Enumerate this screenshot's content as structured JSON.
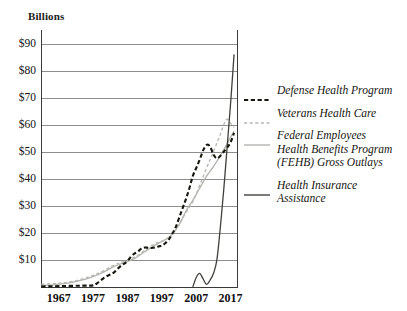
{
  "axis_unit_label": "Billions",
  "colors": {
    "defense": "#16160f",
    "veterans": "#b9b9b4",
    "fehb": "#b3b3ae",
    "hia": "#41413c",
    "axis": "#3a3a3a",
    "grid": "#8d8d8d",
    "text": "#15150f",
    "background": "#ffffff"
  },
  "legend": {
    "entries": [
      {
        "label": "Defense Health Program",
        "swatch": "dashed-bold-dark",
        "icon": "dashed-line-icon"
      },
      {
        "label": "Veterans Health Care",
        "swatch": "dashed-light-gray",
        "icon": "dashed-line-icon"
      },
      {
        "label": "Federal Employees\nHealth Benefits Program\n(FEHB) Gross Outlays",
        "swatch": "solid-light-gray",
        "icon": "solid-line-icon"
      },
      {
        "label": "Health Insurance\nAssistance",
        "swatch": "solid-dark",
        "icon": "solid-line-icon"
      }
    ]
  },
  "chart_data": {
    "type": "line",
    "title": "",
    "subtitle": "",
    "xlabel": "",
    "ylabel": "Billions",
    "ylim": [
      0,
      95
    ],
    "xlim": [
      1962,
      2019
    ],
    "grid": true,
    "gridlines_y": [
      10,
      20,
      30,
      40,
      50,
      60,
      70,
      80,
      90
    ],
    "legend_position": "right",
    "ytick_labels": [
      "$90",
      "$80",
      "$70",
      "$60",
      "$50",
      "$40",
      "$30",
      "$20",
      "$10"
    ],
    "ytick_values": [
      90,
      80,
      70,
      60,
      50,
      40,
      30,
      20,
      10
    ],
    "xtick_labels": [
      "1967",
      "1977",
      "1987",
      "1997",
      "2007",
      "2017"
    ],
    "xtick_values": [
      1967,
      1977,
      1987,
      1997,
      2007,
      2017
    ],
    "series": [
      {
        "name": "Defense Health Program",
        "style": "dashed",
        "color": "#16160f",
        "width": 2.1,
        "x": [
          1962,
          1966,
          1970,
          1974,
          1977,
          1978,
          1979,
          1980,
          1981,
          1982,
          1983,
          1984,
          1985,
          1986,
          1987,
          1988,
          1989,
          1990,
          1991,
          1992,
          1993,
          1994,
          1995,
          1996,
          1997,
          1998,
          1999,
          2000,
          2001,
          2002,
          2003,
          2004,
          2005,
          2006,
          2007,
          2008,
          2009,
          2010,
          2011,
          2012,
          2013,
          2014,
          2015,
          2016,
          2017,
          2018
        ],
        "y": [
          0.2,
          0.3,
          0.4,
          0.5,
          0.6,
          1.2,
          2.2,
          3.2,
          4.0,
          4.6,
          5.3,
          6.6,
          7.7,
          8.6,
          9.6,
          11.2,
          12.3,
          13.0,
          14.2,
          14.6,
          14.5,
          14.4,
          14.6,
          15.0,
          15.3,
          16.2,
          17.5,
          19.6,
          22.0,
          25.5,
          29.0,
          32.5,
          36.5,
          41.0,
          44.0,
          47.0,
          50.5,
          52.5,
          52.0,
          49.0,
          47.5,
          48.5,
          50.0,
          51.5,
          53.5,
          57.0
        ]
      },
      {
        "name": "Veterans Health Care",
        "style": "dashed",
        "color": "#b9b9b4",
        "width": 1.4,
        "x": [
          1962,
          1966,
          1970,
          1974,
          1977,
          1980,
          1983,
          1986,
          1989,
          1992,
          1995,
          1998,
          2000,
          2002,
          2004,
          2006,
          2008,
          2010,
          2012,
          2014,
          2015,
          2016,
          2017,
          2018
        ],
        "y": [
          1.0,
          1.3,
          1.8,
          3.0,
          4.3,
          6.0,
          8.0,
          9.5,
          11.0,
          13.5,
          16.0,
          17.5,
          19.5,
          23.0,
          27.5,
          31.5,
          37.5,
          44.0,
          50.0,
          56.5,
          60.0,
          62.0,
          60.5,
          59.0
        ]
      },
      {
        "name": "Federal Employees Health Benefits Program (FEHB) Gross Outlays",
        "style": "solid",
        "color": "#b3b3ae",
        "width": 1.3,
        "x": [
          1962,
          1966,
          1970,
          1974,
          1977,
          1980,
          1983,
          1986,
          1989,
          1992,
          1995,
          1998,
          2000,
          2002,
          2004,
          2006,
          2008,
          2010,
          2012,
          2014,
          2016,
          2017,
          2018
        ],
        "y": [
          0.5,
          0.9,
          1.5,
          2.6,
          3.8,
          5.5,
          7.5,
          9.0,
          10.5,
          13.0,
          15.5,
          17.5,
          19.5,
          23.0,
          28.0,
          32.0,
          36.5,
          41.0,
          44.5,
          48.5,
          53.0,
          55.5,
          57.5
        ]
      },
      {
        "name": "Health Insurance Assistance",
        "style": "solid",
        "color": "#41413c",
        "width": 1.3,
        "x": [
          2006,
          2007,
          2008,
          2009,
          2010,
          2011,
          2012,
          2013,
          2014,
          2015,
          2016,
          2017,
          2018
        ],
        "y": [
          0.0,
          3.5,
          5.0,
          3.0,
          1.0,
          2.5,
          5.0,
          10.0,
          22.0,
          36.0,
          52.0,
          68.0,
          86.0
        ]
      }
    ]
  }
}
